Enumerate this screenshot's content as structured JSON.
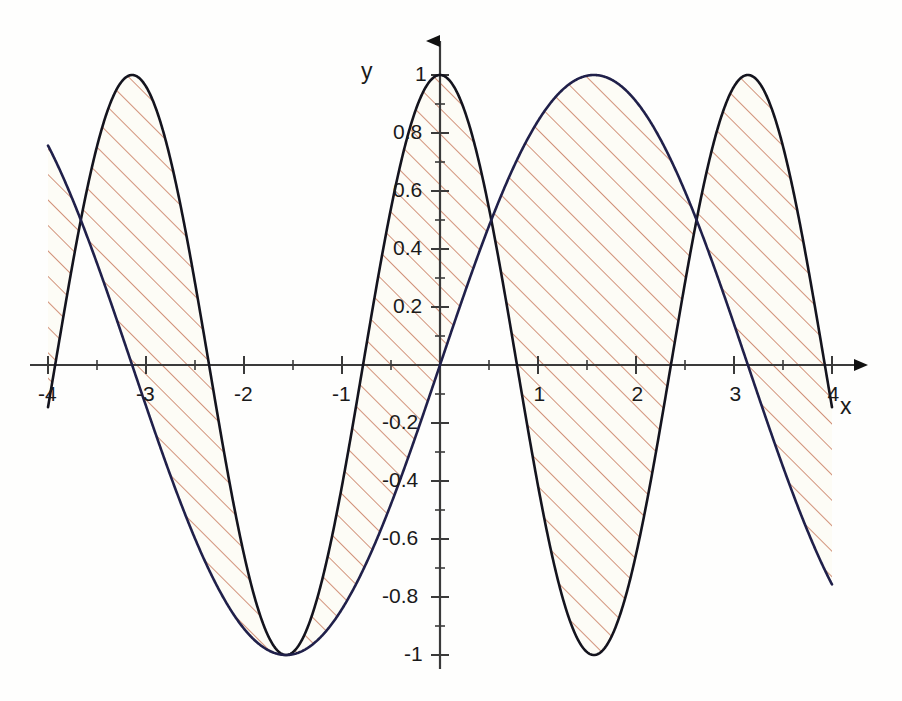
{
  "chart_data": {
    "type": "line",
    "title": "",
    "subtitle": "",
    "xlabel": "x",
    "ylabel": "y",
    "xlim": [
      -4,
      4
    ],
    "ylim": [
      -1,
      1
    ],
    "grid": false,
    "legend_position": "none",
    "annotations": [],
    "shaded_region": {
      "description": "area between the two curves",
      "fill_pattern": "diagonal-hatch",
      "hatch_color": "#c8785c",
      "hatch_angle_deg": 45,
      "hatch_spacing_px": 18,
      "background_color": "#fdfcf6"
    },
    "x_ticks_major": [
      -4,
      -3,
      -2,
      -1,
      0,
      1,
      2,
      3,
      4
    ],
    "x_tick_labels": [
      "-4",
      "-3",
      "-2",
      "-1",
      "",
      "1",
      "2",
      "3",
      "4"
    ],
    "x_ticks_minor_step": 0.5,
    "y_ticks_major": [
      -1,
      -0.8,
      -0.6,
      -0.4,
      -0.2,
      0,
      0.2,
      0.4,
      0.6,
      0.8,
      1
    ],
    "y_tick_labels": [
      "-1",
      "-0.8",
      "-0.6",
      "-0.4",
      "-0.2",
      "",
      "0.2",
      "0.4",
      "0.6",
      "0.8",
      "1"
    ],
    "y_ticks_minor_step": 0.1,
    "series": [
      {
        "name": "cos(2x)",
        "color": "#14141e",
        "width": 2.6,
        "expr": "cos(2*x)",
        "sample_points": [
          {
            "x": -4.0,
            "y": -0.146
          },
          {
            "x": -3.5,
            "y": 0.754
          },
          {
            "x": -3.0,
            "y": 0.96
          },
          {
            "x": -2.5,
            "y": 0.284
          },
          {
            "x": -2.0,
            "y": -0.654
          },
          {
            "x": -1.5,
            "y": -0.99
          },
          {
            "x": -1.0,
            "y": -0.416
          },
          {
            "x": -0.5,
            "y": 0.54
          },
          {
            "x": 0.0,
            "y": 1.0
          },
          {
            "x": 0.5,
            "y": 0.54
          },
          {
            "x": 1.0,
            "y": -0.416
          },
          {
            "x": 1.5,
            "y": -0.99
          },
          {
            "x": 2.0,
            "y": -0.654
          },
          {
            "x": 2.5,
            "y": 0.284
          },
          {
            "x": 3.0,
            "y": 0.96
          },
          {
            "x": 3.5,
            "y": 0.754
          },
          {
            "x": 4.0,
            "y": -0.146
          }
        ]
      },
      {
        "name": "sin(x)",
        "color": "#20204a",
        "width": 2.6,
        "expr": "sin(x)",
        "sample_points": [
          {
            "x": -4.0,
            "y": 0.757
          },
          {
            "x": -3.5,
            "y": 0.351
          },
          {
            "x": -3.0,
            "y": -0.141
          },
          {
            "x": -2.5,
            "y": -0.599
          },
          {
            "x": -2.0,
            "y": -0.909
          },
          {
            "x": -1.5,
            "y": -0.997
          },
          {
            "x": -1.0,
            "y": -0.841
          },
          {
            "x": -0.5,
            "y": -0.479
          },
          {
            "x": 0.0,
            "y": 0.0
          },
          {
            "x": 0.5,
            "y": 0.479
          },
          {
            "x": 1.0,
            "y": 0.841
          },
          {
            "x": 1.5,
            "y": 0.997
          },
          {
            "x": 2.0,
            "y": 0.909
          },
          {
            "x": 2.5,
            "y": 0.599
          },
          {
            "x": 3.0,
            "y": 0.141
          },
          {
            "x": 3.5,
            "y": -0.351
          },
          {
            "x": 4.0,
            "y": -0.757
          }
        ]
      }
    ],
    "geometry": {
      "origin_px": [
        440,
        365
      ],
      "x_scale_px_per_unit": 98,
      "y_scale_px_per_unit": 290,
      "axis_color": "#3a3a3a",
      "arrow_color": "#111111"
    }
  },
  "axes": {
    "x_label": "x",
    "y_label": "y"
  }
}
